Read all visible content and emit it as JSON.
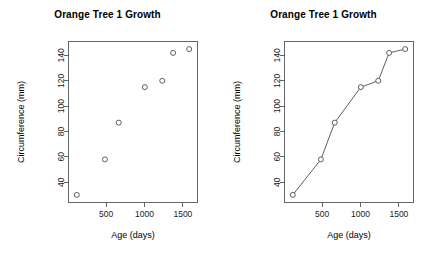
{
  "figure": {
    "width": 431,
    "height": 259,
    "background": "#ffffff",
    "ink_color": "#4d4d4d",
    "axis_color": "#555555",
    "text_color": "#000000"
  },
  "panels": [
    {
      "id": "scatter",
      "title": "Orange Tree 1 Growth",
      "xlabel": "Age (days)",
      "ylabel": "Circumference (mm)"
    },
    {
      "id": "connected",
      "title": "Orange Tree 1 Growth",
      "xlabel": "Age (days)",
      "ylabel": "Circumference (mm)"
    }
  ],
  "chart_data": [
    {
      "type": "scatter",
      "title": "Orange Tree 1 Growth",
      "xlabel": "Age (days)",
      "ylabel": "Circumference (mm)",
      "x": [
        118,
        484,
        664,
        1004,
        1231,
        1372,
        1582
      ],
      "values": [
        30,
        58,
        87,
        115,
        120,
        142,
        145
      ],
      "xlim": [
        10,
        1690
      ],
      "ylim": [
        24,
        151
      ],
      "xticks": [
        500,
        1000,
        1500
      ],
      "xtick_labels": [
        "500",
        "1000",
        "1500"
      ],
      "yticks": [
        40,
        60,
        80,
        100,
        120,
        140
      ],
      "ytick_labels": [
        "40",
        "60",
        "80",
        "100",
        "120",
        "140"
      ],
      "grid": false,
      "legend": "none",
      "marker": "open-circle",
      "line": false
    },
    {
      "type": "line",
      "title": "Orange Tree 1 Growth",
      "xlabel": "Age (days)",
      "ylabel": "Circumference (mm)",
      "x": [
        118,
        484,
        664,
        1004,
        1231,
        1372,
        1582
      ],
      "values": [
        30,
        58,
        87,
        115,
        120,
        142,
        145
      ],
      "xlim": [
        10,
        1690
      ],
      "ylim": [
        24,
        151
      ],
      "xticks": [
        500,
        1000,
        1500
      ],
      "xtick_labels": [
        "500",
        "1000",
        "1500"
      ],
      "yticks": [
        40,
        60,
        80,
        100,
        120,
        140
      ],
      "ytick_labels": [
        "40",
        "60",
        "80",
        "100",
        "120",
        "140"
      ],
      "grid": false,
      "legend": "none",
      "marker": "open-circle",
      "line": true
    }
  ]
}
